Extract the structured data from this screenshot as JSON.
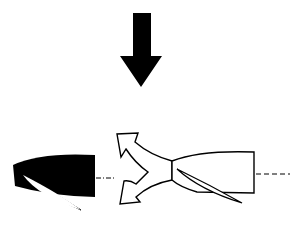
{
  "diagram": {
    "type": "thrust-reverser-illustration",
    "colors": {
      "background": "#ffffff",
      "ink": "#000000",
      "fill_white": "#ffffff"
    },
    "elements": [
      {
        "name": "downward-arrow",
        "description": "Large solid black arrow pointing down"
      },
      {
        "name": "left-nacelle-black",
        "description": "Solid black engine nacelle with white blade cutout"
      },
      {
        "name": "left-centerline",
        "description": "Dash-dot center line"
      },
      {
        "name": "reverse-flow-arrows",
        "description": "Outlined forked arrow showing flow directed forward, up and down"
      },
      {
        "name": "right-nacelle-outline",
        "description": "Outlined white engine nacelle with blade"
      },
      {
        "name": "right-centerline",
        "description": "Dashed center line"
      }
    ]
  }
}
